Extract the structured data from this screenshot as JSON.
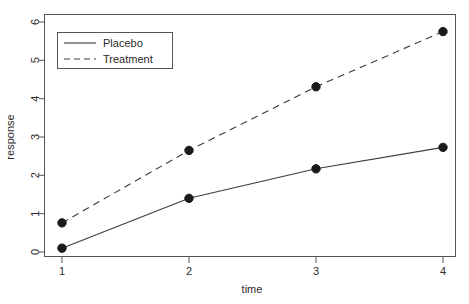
{
  "chart_data": {
    "type": "line",
    "title": "",
    "subtitle": "",
    "xlabel": "time",
    "ylabel": "response",
    "x": [
      1,
      2,
      3,
      4
    ],
    "xtick_labels": [
      "1",
      "2",
      "3",
      "4"
    ],
    "ytick_labels": [
      "0",
      "1",
      "2",
      "3",
      "4",
      "5",
      "6"
    ],
    "yticks": [
      0,
      1,
      2,
      3,
      4,
      5,
      6
    ],
    "xlim": [
      0.8,
      4.2
    ],
    "ylim": [
      0,
      6
    ],
    "grid": false,
    "legend_position": "top-left",
    "markers": "filled-circle",
    "series": [
      {
        "name": "Placebo",
        "linestyle": "solid",
        "color": "#3b3b3b",
        "values": [
          0.1,
          1.4,
          2.17,
          2.73
        ]
      },
      {
        "name": "Treatment",
        "linestyle": "dashed",
        "color": "#3b3b3b",
        "values": [
          0.76,
          2.65,
          4.31,
          5.75
        ]
      }
    ],
    "legend": [
      {
        "label": "Placebo",
        "linestyle": "solid"
      },
      {
        "label": "Treatment",
        "linestyle": "dashed"
      }
    ]
  },
  "figure": {
    "background_color": "#ffffff",
    "frame_color": "#555555",
    "text_color": "#2b2b2b"
  }
}
